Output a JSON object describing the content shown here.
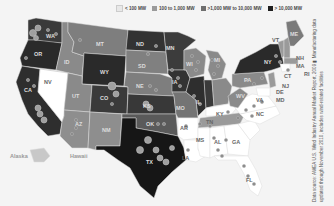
{
  "map": {
    "title": "U.S. Wind Power Installed Capacity by State",
    "colors": {
      "lt100": "#ffffff",
      "r100_1000": "#9a9a9a",
      "r1000_10000": "#6e6e6e",
      "gt10000": "#1e1e1e",
      "none": "#f4f4f4",
      "dot": "#8a8a8a"
    },
    "legend": [
      {
        "label": "< 100 MW",
        "color": "#f0f0f0"
      },
      {
        "label": "100 to 1,000 MW",
        "color": "#9a9a9a"
      },
      {
        "label": ">1,000 MW to 10,000 MW",
        "color": "#6e6e6e"
      },
      {
        "label": "> 10,000 MW",
        "color": "#1e1e1e"
      }
    ],
    "states": {
      "WA": "WA",
      "OR": "OR",
      "CA": "CA",
      "NV": "NV",
      "ID": "ID",
      "MT": "MT",
      "WY": "WY",
      "UT": "UT",
      "AZ": "AZ",
      "CO": "CO",
      "NM": "NM",
      "ND": "ND",
      "SD": "SD",
      "NE": "NE",
      "KS": "KS",
      "OK": "OK",
      "TX": "TX",
      "MN": "MN",
      "IA": "IA",
      "MO": "MO",
      "AR": "AR",
      "LA": "LA",
      "WI": "WI",
      "IL": "IL",
      "MI": "MI",
      "IN": "IN",
      "OH": "OH",
      "KY": "KY",
      "TN": "TN",
      "MS": "MS",
      "AL": "AL",
      "GA": "GA",
      "FL": "FL",
      "SC": "SC",
      "NC": "NC",
      "VA": "VA",
      "WV": "WV",
      "PA": "PA",
      "NY": "NY",
      "VT": "VT",
      "NH": "NH",
      "ME": "ME",
      "MA": "MA",
      "RI": "RI",
      "CT": "CT",
      "NJ": "NJ",
      "DE": "DE",
      "MD": "MD",
      "Alaska": "Alaska",
      "Hawaii": "Hawaii"
    }
  },
  "source_note": "Data source: AWEA U.S. Wind Industry Annual Market Report, 2009  ▮  Manufacturing data updated through November 2010, includes wind-related facilities"
}
